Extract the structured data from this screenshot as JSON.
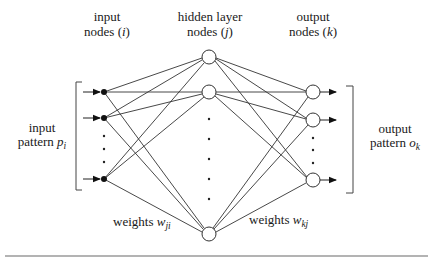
{
  "diagram": {
    "type": "feedforward-neural-network",
    "headers": {
      "input": {
        "line1": "input",
        "line2_text": "nodes (",
        "line2_var": "i",
        "line2_close": ")"
      },
      "hidden": {
        "line1": "hidden layer",
        "line2_text": "nodes (",
        "line2_var": "j",
        "line2_close": ")"
      },
      "output": {
        "line1": "output",
        "line2_text": "nodes (",
        "line2_var": "k",
        "line2_close": ")"
      }
    },
    "input_pattern": {
      "line1": "input",
      "line2_text": "pattern ",
      "var": "p",
      "sub": "i"
    },
    "output_pattern": {
      "line1": "output",
      "line2_text": "pattern ",
      "var": "o",
      "sub": "k"
    },
    "weights_input_hidden": {
      "text": "weights ",
      "var": "w",
      "sub": "ji"
    },
    "weights_hidden_output": {
      "text": "weights ",
      "var": "w",
      "sub": "kj"
    },
    "layers": {
      "input": {
        "node_style": "filled-dot",
        "visible_nodes": 3,
        "ellipsis_dots": 3
      },
      "hidden": {
        "node_style": "open-circle",
        "visible_nodes": 3,
        "ellipsis_dots": 5
      },
      "output": {
        "node_style": "open-circle",
        "visible_nodes": 3,
        "ellipsis_dots": 3
      }
    },
    "connectivity": "fully-connected",
    "colors": {
      "line": "#333333",
      "rule": "#9a9a9a",
      "background": "#ffffff"
    }
  }
}
